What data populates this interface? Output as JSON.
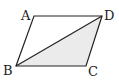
{
  "diagram": {
    "type": "parallelogram",
    "vertices": {
      "A": {
        "label": "A",
        "x": 34,
        "y": 16
      },
      "D": {
        "label": "D",
        "x": 102,
        "y": 16
      },
      "B": {
        "label": "B",
        "x": 16,
        "y": 66
      },
      "C": {
        "label": "C",
        "x": 86,
        "y": 66
      }
    },
    "diagonal": [
      "B",
      "D"
    ],
    "shaded_region": [
      "B",
      "C",
      "D"
    ],
    "colors": {
      "stroke": "#222222",
      "shade": "#ebebeb",
      "background": "#ffffff"
    }
  }
}
